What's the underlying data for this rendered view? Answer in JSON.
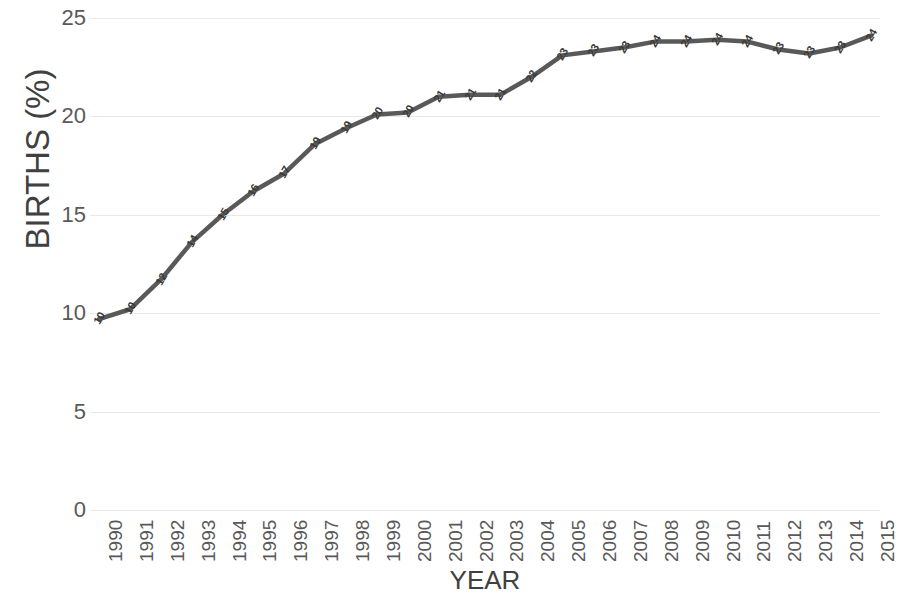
{
  "chart_data": {
    "type": "line",
    "title": "",
    "xlabel": "YEAR",
    "ylabel": "BIRTHS (%)",
    "x": [
      "1990",
      "1991",
      "1992",
      "1993",
      "1994",
      "1995",
      "1996",
      "1997",
      "1998",
      "1999",
      "2000",
      "2001",
      "2002",
      "2003",
      "2004",
      "2005",
      "2006",
      "2007",
      "2008",
      "2009",
      "2010",
      "2011",
      "2012",
      "2013",
      "2014",
      "2015"
    ],
    "values": [
      9.7,
      10.2,
      11.7,
      13.6,
      15.0,
      16.2,
      17.1,
      18.6,
      19.4,
      20.1,
      20.2,
      21.0,
      21.1,
      21.1,
      22.0,
      23.1,
      23.3,
      23.5,
      23.8,
      23.8,
      23.9,
      23.8,
      23.4,
      23.2,
      23.5,
      24.1
    ],
    "point_labels": [
      "10",
      "10",
      "12",
      "14",
      "15",
      "16",
      "17",
      "19",
      "19",
      "20",
      "20",
      "21",
      "21",
      "21",
      "22",
      "23",
      "23",
      "23",
      "24",
      "24",
      "24",
      "24",
      "23",
      "23",
      "23",
      "24"
    ],
    "ylim": [
      0,
      25
    ],
    "yticks": [
      0,
      5,
      10,
      15,
      20,
      25
    ],
    "ytick_labels": [
      "0",
      "5",
      "10",
      "15",
      "20",
      "25"
    ],
    "grid": true,
    "legend": "none",
    "series_color": "#595959",
    "grid_color": "#e9e9e9",
    "text_color": "#595959",
    "axis_title_color": "#404040",
    "background": "#ffffff"
  }
}
